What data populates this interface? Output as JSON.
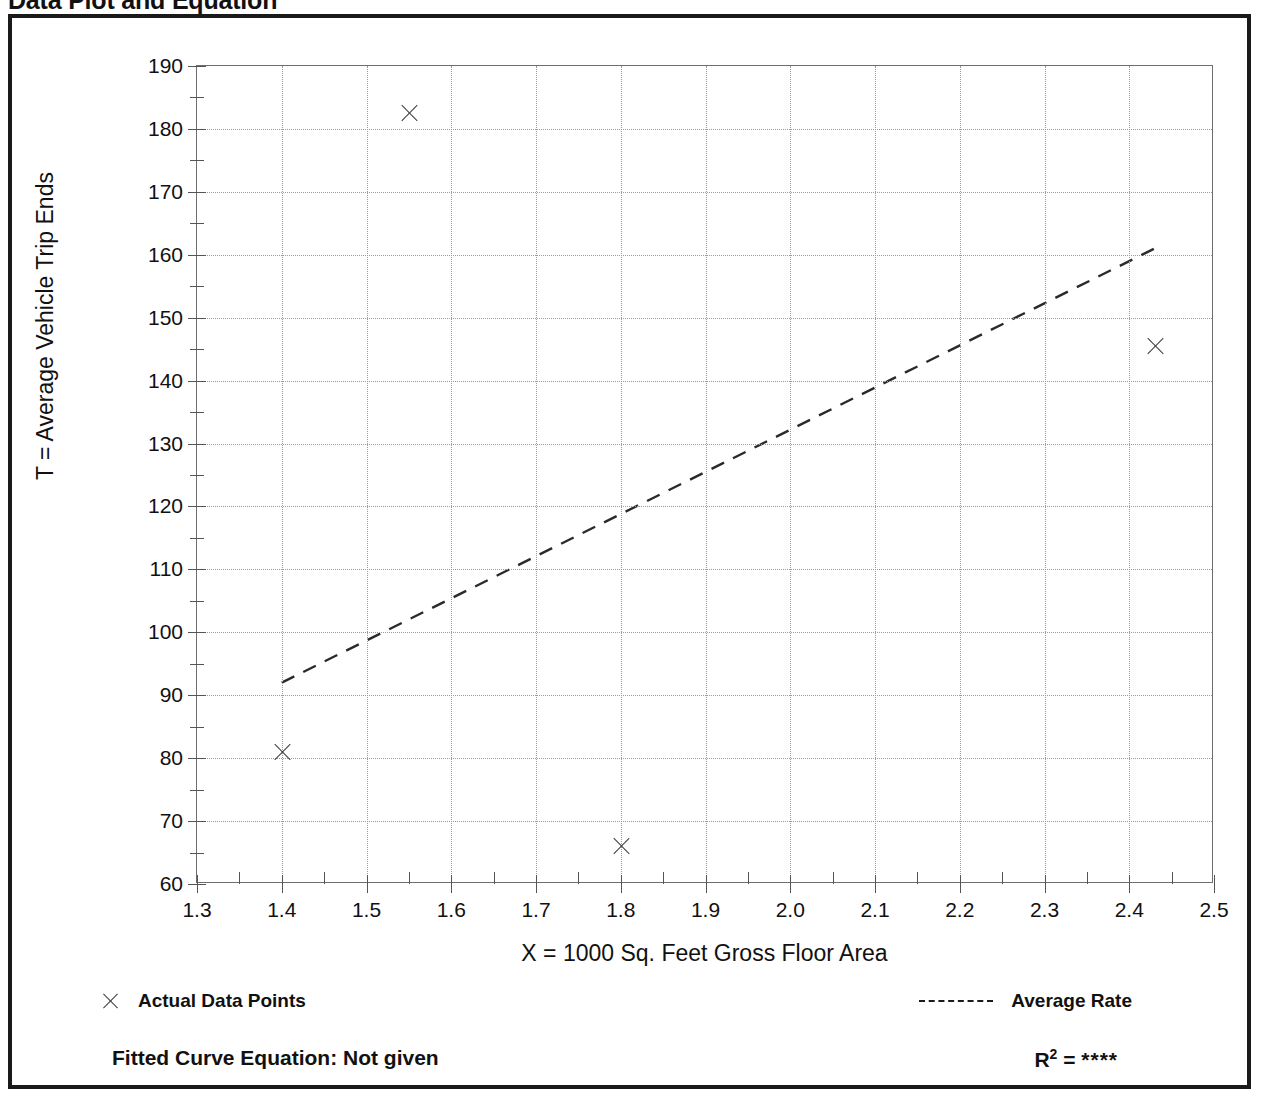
{
  "page": {
    "title": "Data Plot and Equation"
  },
  "legend": {
    "data_points_label": "Actual Data Points",
    "average_rate_label": "Average Rate",
    "data_point_icon": "x-marker-icon",
    "average_rate_icon": "dashed-line-icon"
  },
  "footer": {
    "equation_label": "Fitted Curve Equation:  Not given",
    "r2_label": "R",
    "r2_exponent": "2",
    "r2_equals": " = ",
    "r2_value": "****"
  },
  "chart_data": {
    "type": "scatter",
    "title": "Data Plot and Equation",
    "xlabel": "X = 1000 Sq. Feet Gross Floor Area",
    "ylabel": "T = Average Vehicle Trip Ends",
    "xlim": [
      1.3,
      2.5
    ],
    "ylim": [
      60,
      190
    ],
    "xticks": [
      "1.3",
      "1.4",
      "1.5",
      "1.6",
      "1.7",
      "1.8",
      "1.9",
      "2.0",
      "2.1",
      "2.2",
      "2.3",
      "2.4",
      "2.5"
    ],
    "xtick_values": [
      1.3,
      1.4,
      1.5,
      1.6,
      1.7,
      1.8,
      1.9,
      2.0,
      2.1,
      2.2,
      2.3,
      2.4,
      2.5
    ],
    "yticks": [
      "190",
      "180",
      "170",
      "160",
      "150",
      "140",
      "130",
      "120",
      "110",
      "100",
      "90",
      "80",
      "70",
      "60"
    ],
    "ytick_values": [
      190,
      180,
      170,
      160,
      150,
      140,
      130,
      120,
      110,
      100,
      90,
      80,
      70,
      60
    ],
    "grid": true,
    "legend_position": "below-plot",
    "series": [
      {
        "name": "Actual Data Points",
        "marker": "x",
        "points": [
          {
            "x": 1.4,
            "y": 81.0
          },
          {
            "x": 1.55,
            "y": 182.5
          },
          {
            "x": 1.8,
            "y": 66.0
          },
          {
            "x": 2.43,
            "y": 145.5
          }
        ]
      },
      {
        "name": "Average Rate",
        "style": "dashed-line",
        "points": [
          {
            "x": 1.4,
            "y": 92.0
          },
          {
            "x": 2.43,
            "y": 161.0
          }
        ]
      }
    ]
  }
}
